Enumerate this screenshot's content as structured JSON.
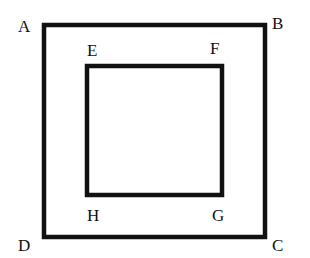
{
  "diagram": {
    "type": "nested-squares",
    "stroke_color": "#111111",
    "background": "#ffffff",
    "outer_square": {
      "vertices": [
        "A",
        "B",
        "C",
        "D"
      ],
      "labels": {
        "A": "A",
        "B": "B",
        "C": "C",
        "D": "D"
      }
    },
    "inner_square": {
      "vertices": [
        "E",
        "F",
        "G",
        "H"
      ],
      "labels": {
        "E": "E",
        "F": "F",
        "G": "G",
        "H": "H"
      }
    }
  }
}
